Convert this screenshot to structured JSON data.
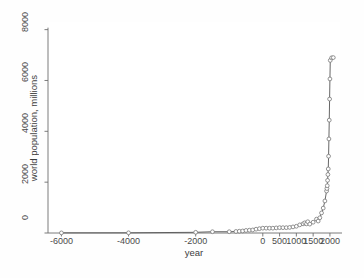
{
  "chart_data": {
    "type": "line",
    "title": "",
    "subtitle": "",
    "xlabel": "year",
    "ylabel": "world population, millions",
    "xlim": [
      -6400,
      2300
    ],
    "ylim": [
      0,
      8300
    ],
    "grid": false,
    "legend": null,
    "marker": "open-circle",
    "line_color": "#555555",
    "marker_color": "#777777",
    "xticks": [
      -6000,
      -4000,
      -2000,
      0,
      500,
      1000,
      1500,
      2000
    ],
    "xtick_labels": [
      "-6000",
      "-4000",
      "-2000",
      "0",
      "500",
      "1000",
      "1500",
      "2000"
    ],
    "yticks": [
      0,
      2000,
      4000,
      6000,
      8000
    ],
    "ytick_labels": [
      "0",
      "2000",
      "4000",
      "6000",
      "8000"
    ],
    "x": [
      -6000,
      -4000,
      -2000,
      -1500,
      -1000,
      -800,
      -700,
      -600,
      -500,
      -400,
      -300,
      -200,
      -100,
      0,
      100,
      200,
      300,
      400,
      500,
      600,
      700,
      800,
      900,
      1000,
      1100,
      1200,
      1250,
      1300,
      1340,
      1400,
      1500,
      1600,
      1650,
      1700,
      1750,
      1800,
      1850,
      1900,
      1910,
      1920,
      1930,
      1940,
      1950,
      1960,
      1970,
      1980,
      1990,
      2000,
      2010,
      2050,
      2100
    ],
    "y": [
      5,
      7,
      27,
      50,
      50,
      60,
      70,
      80,
      100,
      110,
      120,
      150,
      170,
      190,
      190,
      190,
      190,
      200,
      210,
      210,
      210,
      220,
      240,
      265,
      320,
      360,
      400,
      360,
      443,
      350,
      425,
      545,
      470,
      600,
      790,
      980,
      1260,
      1650,
      1750,
      1860,
      2070,
      2300,
      2520,
      3020,
      3700,
      4440,
      5270,
      6060,
      6790,
      6890,
      6900
    ],
    "series": [
      {
        "name": "world population",
        "values": [
          5,
          7,
          27,
          50,
          50,
          60,
          70,
          80,
          100,
          110,
          120,
          150,
          170,
          190,
          190,
          190,
          190,
          200,
          210,
          210,
          210,
          220,
          240,
          265,
          320,
          360,
          400,
          360,
          443,
          350,
          425,
          545,
          470,
          600,
          790,
          980,
          1260,
          1650,
          1750,
          1860,
          2070,
          2300,
          2520,
          3020,
          3700,
          4440,
          5270,
          6060,
          6790,
          6890,
          6900
        ]
      }
    ]
  }
}
